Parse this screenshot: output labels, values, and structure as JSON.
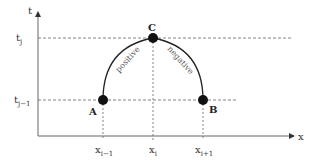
{
  "diagram": {
    "axes": {
      "y_label": "t",
      "x_label": "x"
    },
    "horizontal_guides": [
      {
        "id": "tj",
        "label": "t",
        "sub": "j"
      },
      {
        "id": "tj_minus_1",
        "label": "t",
        "sub": "j−1"
      }
    ],
    "vertical_guides": [
      {
        "id": "xi_minus_1",
        "label": "x",
        "sub": "i−1"
      },
      {
        "id": "xi",
        "label": "x",
        "sub": "i"
      },
      {
        "id": "xi_plus_1",
        "label": "x",
        "sub": "i+1"
      }
    ],
    "points": {
      "A": "A",
      "B": "B",
      "C": "C"
    },
    "curves": {
      "left": "positive",
      "right": "negative"
    },
    "colors": {
      "axis": "#666666",
      "guide": "#777777",
      "curve": "#222222",
      "point": "#111111"
    }
  }
}
